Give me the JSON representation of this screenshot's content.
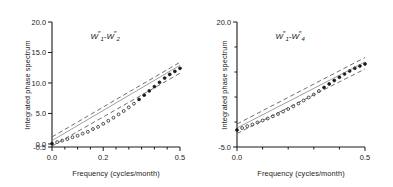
{
  "figure": {
    "background": "#ffffff",
    "axis_color": "#1a1a1a",
    "marker_color": "#1a1a1a",
    "bound_color": "#555555",
    "fit_color": "#777777"
  },
  "chart_data": [
    {
      "type": "line",
      "panel": "left",
      "title": "W″1 - W″2",
      "title_parts": {
        "var": "W",
        "prime": "″",
        "sub_a": "1",
        "sub_b": "2",
        "dash": "-"
      },
      "xlabel": "Frequency  (cycles/month)",
      "ylabel": "Integrated phase spectrum",
      "xlim": [
        0.0,
        0.5
      ],
      "ylim": [
        -0.5,
        20.0
      ],
      "xticks": [
        0.0,
        0.05,
        0.1,
        0.15,
        0.2,
        0.25,
        0.3,
        0.35,
        0.4,
        0.45,
        0.5
      ],
      "xticklabels": [
        {
          "value": 0.0,
          "label": "0.0"
        },
        {
          "value": 0.2,
          "label": "0.2"
        },
        {
          "value": 0.5,
          "label": "0.5"
        }
      ],
      "yticks": [
        -0.5,
        0.0,
        5.0,
        10.0,
        15.0,
        20.0
      ],
      "yticklabels": [
        {
          "value": 20.0,
          "label": "20.0"
        },
        {
          "value": 15.0,
          "label": "15.0"
        },
        {
          "value": 10.0,
          "label": "10.0"
        },
        {
          "value": 5.0,
          "label": "5.0"
        },
        {
          "value": 0.0,
          "label": "0.0"
        },
        {
          "value": -0.5,
          "label": "-0.5"
        }
      ],
      "grid": false,
      "legend": "none",
      "series": [
        {
          "name": "Integrated phase spectrum (data)",
          "style": "markers",
          "marker": "circle",
          "x": [
            0.0,
            0.02,
            0.04,
            0.06,
            0.08,
            0.1,
            0.12,
            0.14,
            0.16,
            0.18,
            0.2,
            0.22,
            0.24,
            0.26,
            0.28,
            0.3,
            0.32,
            0.34,
            0.36,
            0.38,
            0.4,
            0.42,
            0.44,
            0.46,
            0.48,
            0.5
          ],
          "values": [
            0.05,
            0.3,
            0.55,
            0.8,
            1.1,
            1.35,
            1.7,
            2.0,
            2.45,
            2.8,
            3.3,
            3.8,
            4.3,
            4.85,
            5.4,
            6.0,
            6.6,
            7.3,
            8.0,
            8.7,
            9.4,
            10.1,
            10.8,
            11.4,
            11.9,
            12.4
          ]
        },
        {
          "name": "Fitted line",
          "style": "thin-solid",
          "x": [
            0.0,
            0.5
          ],
          "values": [
            0.55,
            12.9
          ]
        },
        {
          "name": "Upper confidence bound",
          "style": "dashed",
          "x": [
            0.0,
            0.5
          ],
          "values": [
            1.15,
            13.4
          ]
        },
        {
          "name": "Lower confidence bound",
          "style": "dashed",
          "x": [
            0.0,
            0.5
          ],
          "values": [
            -0.35,
            11.6
          ]
        }
      ]
    },
    {
      "type": "line",
      "panel": "right",
      "title": "W″1 - W″4",
      "title_parts": {
        "var": "W",
        "prime": "″",
        "sub_a": "1",
        "sub_b": "4",
        "dash": "-"
      },
      "xlabel": "Frequency  (cycles/month)",
      "ylabel": "Integrated phase spectrum",
      "xlim": [
        0.0,
        0.5
      ],
      "ylim": [
        -5.0,
        20.0
      ],
      "xticks": [
        0.0,
        0.1,
        0.2,
        0.3,
        0.4,
        0.5
      ],
      "xticklabels": [
        {
          "value": 0.0,
          "label": "0.0"
        },
        {
          "value": 0.5,
          "label": "0.5"
        }
      ],
      "yticks": [
        -5.0,
        0.0,
        5.0,
        10.0,
        15.0,
        20.0
      ],
      "yticklabels": [
        {
          "value": 20.0,
          "label": "20.0"
        },
        {
          "value": -5.0,
          "label": "-5.0"
        }
      ],
      "grid": false,
      "legend": "none",
      "series": [
        {
          "name": "Integrated phase spectrum (data)",
          "style": "markers",
          "marker": "circle",
          "x": [
            0.0,
            0.02,
            0.04,
            0.06,
            0.08,
            0.1,
            0.12,
            0.14,
            0.16,
            0.18,
            0.2,
            0.22,
            0.24,
            0.26,
            0.28,
            0.3,
            0.32,
            0.34,
            0.36,
            0.38,
            0.4,
            0.42,
            0.44,
            0.46,
            0.48,
            0.5
          ],
          "values": [
            -1.6,
            -1.2,
            -0.85,
            -0.5,
            -0.1,
            0.3,
            0.7,
            1.15,
            1.6,
            2.1,
            2.6,
            3.15,
            3.7,
            4.3,
            4.9,
            5.5,
            6.2,
            6.9,
            7.6,
            8.3,
            8.95,
            9.6,
            10.2,
            10.75,
            11.2,
            11.6
          ]
        },
        {
          "name": "Fitted line",
          "style": "thin-solid",
          "x": [
            0.0,
            0.5
          ],
          "values": [
            -1.2,
            12.0
          ]
        },
        {
          "name": "Upper confidence bound",
          "style": "dashed",
          "x": [
            0.0,
            0.5
          ],
          "values": [
            -0.4,
            12.9
          ]
        },
        {
          "name": "Lower confidence bound",
          "style": "dashed",
          "x": [
            0.0,
            0.5
          ],
          "values": [
            -2.3,
            10.6
          ]
        }
      ]
    }
  ]
}
